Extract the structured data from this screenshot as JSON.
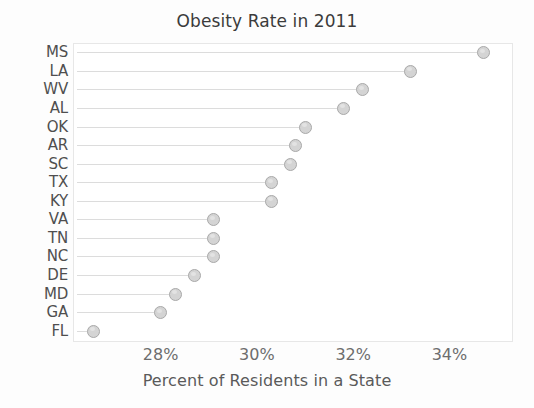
{
  "chart_data": {
    "type": "scatter",
    "title": "Obesity Rate in 2011",
    "xlabel": "Percent of Residents in a State",
    "ylabel": "",
    "grid": false,
    "legend": "none",
    "xlim": [
      26.2,
      35.3
    ],
    "xticks": [
      28,
      30,
      32,
      34
    ],
    "xtick_labels": [
      "28%",
      "30%",
      "32%",
      "34%"
    ],
    "categories": [
      "MS",
      "LA",
      "WV",
      "AL",
      "OK",
      "AR",
      "SC",
      "TX",
      "KY",
      "VA",
      "TN",
      "NC",
      "DE",
      "MD",
      "GA",
      "FL"
    ],
    "values": [
      34.7,
      33.2,
      32.2,
      31.8,
      31.0,
      30.8,
      30.7,
      30.3,
      30.3,
      29.1,
      29.1,
      29.1,
      28.7,
      28.3,
      28.0,
      26.6
    ],
    "points": [
      {
        "label": "MS",
        "value": 34.7
      },
      {
        "label": "LA",
        "value": 33.2
      },
      {
        "label": "WV",
        "value": 32.2
      },
      {
        "label": "AL",
        "value": 31.8
      },
      {
        "label": "OK",
        "value": 31.0
      },
      {
        "label": "AR",
        "value": 30.8
      },
      {
        "label": "SC",
        "value": 30.7
      },
      {
        "label": "TX",
        "value": 30.3
      },
      {
        "label": "KY",
        "value": 30.3
      },
      {
        "label": "VA",
        "value": 29.1
      },
      {
        "label": "TN",
        "value": 29.1
      },
      {
        "label": "NC",
        "value": 29.1
      },
      {
        "label": "DE",
        "value": 28.7
      },
      {
        "label": "MD",
        "value": 28.3
      },
      {
        "label": "GA",
        "value": 28.0
      },
      {
        "label": "FL",
        "value": 26.6
      }
    ],
    "marker_fill": "#d4d4d4",
    "marker_edge": "#a9a9a9",
    "stem_color": "#dcdcdc",
    "frame_color": "#e7e7e7"
  }
}
